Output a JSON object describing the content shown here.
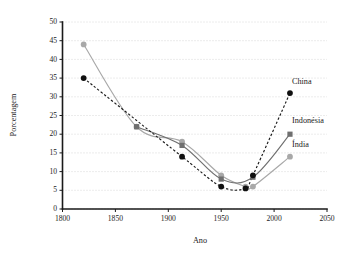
{
  "chart_data": {
    "type": "line",
    "title": "",
    "xlabel": "Ano",
    "ylabel": "Porcentagem",
    "xlim": [
      1800,
      2050
    ],
    "ylim": [
      0,
      50
    ],
    "xticks": [
      1800,
      1850,
      1900,
      1950,
      2000,
      2050
    ],
    "yticks": [
      0,
      5,
      10,
      15,
      20,
      25,
      30,
      35,
      40,
      45,
      50
    ],
    "grid": "horizontal-dotted",
    "legend_position": "inline-right-end-labels",
    "series": [
      {
        "name": "Índia",
        "color": "#a8a8a8",
        "marker": "circle",
        "linestyle": "solid",
        "x": [
          1820,
          1870,
          1913,
          1950,
          1973,
          1980,
          2015
        ],
        "y": [
          44,
          22,
          18,
          9,
          6,
          6,
          14
        ]
      },
      {
        "name": "Indonésia",
        "color": "#6f6f6f",
        "marker": "square",
        "linestyle": "solid",
        "x": [
          1870,
          1913,
          1950,
          1980,
          2015
        ],
        "y": [
          22,
          17,
          8,
          8.5,
          20
        ]
      },
      {
        "name": "China",
        "color": "#101010",
        "marker": "circle",
        "linestyle": "dashed",
        "x": [
          1820,
          1913,
          1950,
          1973,
          1980,
          2015
        ],
        "y": [
          35,
          14,
          6,
          5.5,
          9,
          31
        ]
      }
    ],
    "annotations": [
      {
        "text": "China",
        "x": 2015,
        "y": 34.0
      },
      {
        "text": "Indonésia",
        "x": 2015,
        "y": 23.5
      },
      {
        "text": "Índia",
        "x": 2015,
        "y": 17.0
      }
    ]
  }
}
